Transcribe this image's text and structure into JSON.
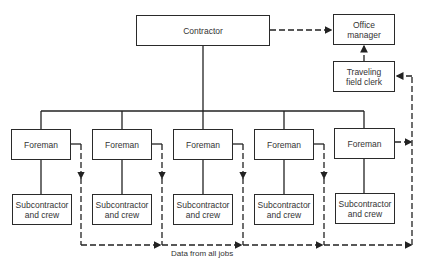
{
  "diagram": {
    "type": "organization-chart",
    "nodes": {
      "contractor": "Contractor",
      "office_manager": [
        "Office",
        "manager"
      ],
      "field_clerk": [
        "Traveling",
        "field clerk"
      ],
      "foremen": [
        "Foreman",
        "Foreman",
        "Foreman",
        "Foreman",
        "Foreman"
      ],
      "subcontractors": [
        [
          "Subcontractor",
          "and crew"
        ],
        [
          "Subcontractor",
          "and crew"
        ],
        [
          "Subcontractor",
          "and crew"
        ],
        [
          "Subcontractor",
          "and crew"
        ],
        [
          "Subcontractor",
          "and crew"
        ]
      ]
    },
    "data_flow_label": "Data from all jobs",
    "edges": [
      {
        "from": "Contractor",
        "to": "Office manager",
        "style": "dashed-arrow"
      },
      {
        "from": "Traveling field clerk",
        "to": "Office manager",
        "style": "dashed-arrow"
      },
      {
        "from": "Contractor",
        "to": "Foreman (x5)",
        "style": "solid"
      },
      {
        "from": "Foreman",
        "to": "Subcontractor and crew",
        "style": "solid"
      },
      {
        "from": "Foreman (each)",
        "to": "Data from all jobs line",
        "style": "dashed-arrow"
      },
      {
        "from": "Data from all jobs line",
        "to": "Traveling field clerk",
        "style": "dashed-arrow"
      }
    ]
  }
}
